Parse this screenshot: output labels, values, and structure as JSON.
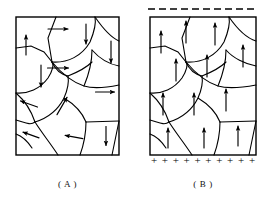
{
  "figure": {
    "background_color": "#ffffff",
    "stroke_color": "#000000",
    "width": 269,
    "height": 210
  },
  "panels": [
    {
      "id": "A",
      "caption": "( A )",
      "box": {
        "x": 16,
        "y": 17,
        "width": 103,
        "height": 138
      },
      "arrow_state": "random",
      "has_top_dashed_line": false,
      "has_bottom_plus_row": false,
      "arrows": [
        {
          "x": 26,
          "y": 45,
          "angle": -90,
          "length": 20
        },
        {
          "x": 58,
          "y": 29,
          "angle": 0,
          "length": 20
        },
        {
          "x": 86,
          "y": 34,
          "angle": 90,
          "length": 20
        },
        {
          "x": 111,
          "y": 52,
          "angle": 90,
          "length": 22
        },
        {
          "x": 58,
          "y": 68,
          "angle": 0,
          "length": 21
        },
        {
          "x": 41,
          "y": 76,
          "angle": 90,
          "length": 22
        },
        {
          "x": 105,
          "y": 92,
          "angle": 0,
          "length": 19
        },
        {
          "x": 29,
          "y": 104,
          "angle": 200,
          "length": 18
        },
        {
          "x": 62,
          "y": 106,
          "angle": -60,
          "length": 20
        },
        {
          "x": 31,
          "y": 135,
          "angle": 200,
          "length": 17
        },
        {
          "x": 74,
          "y": 137,
          "angle": 190,
          "length": 18
        },
        {
          "x": 106,
          "y": 136,
          "angle": 90,
          "length": 19
        }
      ]
    },
    {
      "id": "B",
      "caption": "( B )",
      "box": {
        "x": 150,
        "y": 17,
        "width": 106,
        "height": 138
      },
      "arrow_state": "aligned-up",
      "has_top_dashed_line": true,
      "has_bottom_plus_row": true,
      "top_dashed_line": {
        "y": 9,
        "x_start": 148,
        "x_end": 258,
        "dash_count": 10,
        "dash_length": 7,
        "gap_length": 4
      },
      "bottom_plus_row": {
        "y": 164,
        "symbol": "+",
        "count": 10,
        "x_start": 154,
        "x_end": 252
      },
      "arrows": [
        {
          "x": 161,
          "y": 42,
          "angle": -90,
          "length": 22
        },
        {
          "x": 186,
          "y": 32,
          "angle": -90,
          "length": 22
        },
        {
          "x": 215,
          "y": 34,
          "angle": -90,
          "length": 22
        },
        {
          "x": 243,
          "y": 56,
          "angle": -90,
          "length": 22
        },
        {
          "x": 176,
          "y": 70,
          "angle": -90,
          "length": 22
        },
        {
          "x": 207,
          "y": 66,
          "angle": -90,
          "length": 22
        },
        {
          "x": 163,
          "y": 104,
          "angle": -90,
          "length": 22
        },
        {
          "x": 194,
          "y": 104,
          "angle": -90,
          "length": 22
        },
        {
          "x": 226,
          "y": 100,
          "angle": -90,
          "length": 22
        },
        {
          "x": 168,
          "y": 138,
          "angle": -90,
          "length": 20
        },
        {
          "x": 204,
          "y": 138,
          "angle": -90,
          "length": 20
        },
        {
          "x": 238,
          "y": 136,
          "angle": -90,
          "length": 20
        }
      ]
    }
  ],
  "grain_boundaries_a": [
    "M 16 48 L 31 46 L 44 52 L 52 62",
    "M 52 62 L 48 38 L 56 17",
    "M 52 62 C 68 63 82 56 90 42 C 95 30 96 22 95 17",
    "M 95 17 C 104 30 112 38 119 41",
    "M 16 93 C 28 94 40 89 48 78 C 53 70 54 65 52 62",
    "M 52 62 C 62 74 72 82 84 86 C 94 89 104 88 119 85",
    "M 84 86 C 89 74 92 62 92 50",
    "M 119 66 C 108 64 99 58 92 50",
    "M 16 93 C 24 100 31 110 35 122",
    "M 35 122 C 48 118 58 110 64 98 C 68 89 69 82 68 76",
    "M 68 76 C 60 74 55 69 52 62",
    "M 16 120 C 24 122 30 126 35 122",
    "M 35 122 C 42 133 50 143 58 155",
    "M 64 98 C 74 104 82 112 86 122",
    "M 86 122 L 119 121",
    "M 86 122 C 86 133 84 144 80 155",
    "M 119 121 L 112 155",
    "M 68 76 C 78 72 86 68 92 62",
    "M 16 134 C 22 136 28 142 32 148"
  ],
  "grain_boundaries_b": [
    "M 150 48 L 165 46 L 178 52 L 186 62",
    "M 186 62 L 182 38 L 190 17",
    "M 186 62 C 202 63 216 56 224 42 C 229 30 230 22 229 17",
    "M 229 17 C 238 30 246 38 256 41",
    "M 150 93 C 162 94 174 89 182 78 C 187 70 188 65 186 62",
    "M 186 62 C 196 74 206 82 218 86 C 228 89 240 88 256 85",
    "M 218 86 C 223 74 226 62 226 50",
    "M 256 66 C 245 64 233 58 226 50",
    "M 150 93 C 158 100 165 110 169 122",
    "M 169 122 C 182 118 192 110 198 98 C 202 89 203 82 202 76",
    "M 202 76 C 194 74 189 69 186 62",
    "M 150 120 C 158 122 164 126 169 122",
    "M 169 122 C 176 133 184 143 192 155",
    "M 198 98 C 208 104 216 112 220 122",
    "M 220 122 L 256 121",
    "M 220 122 C 220 133 218 144 214 155",
    "M 256 121 L 249 155",
    "M 202 76 C 212 72 220 68 226 62",
    "M 150 134 C 156 136 162 142 166 148"
  ]
}
